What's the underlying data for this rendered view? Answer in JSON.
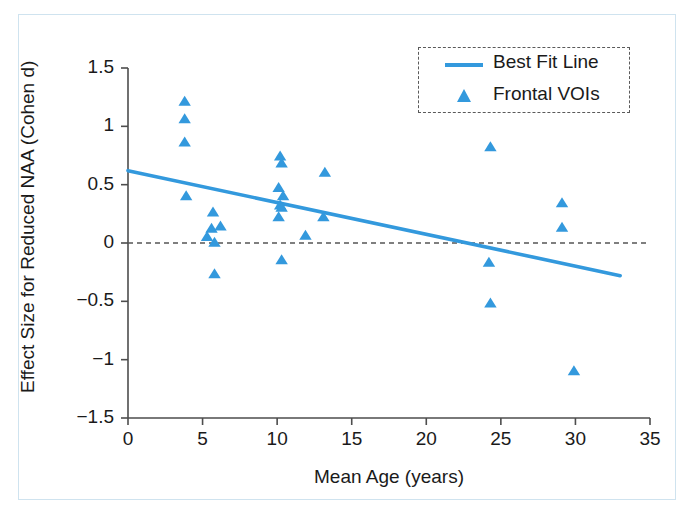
{
  "figure": {
    "background": "#ffffff",
    "frame_color": "#cfe3ef",
    "accent_color": "#3399dd",
    "text_color": "#1a1a1a"
  },
  "legend": {
    "position": "top-right",
    "border_style": "dashed",
    "entries": [
      {
        "label": "Best Fit Line",
        "marker": "line",
        "color": "#3399dd"
      },
      {
        "label": "Frontal VOIs",
        "marker": "triangle",
        "color": "#3399dd"
      }
    ]
  },
  "chart_data": {
    "type": "scatter",
    "title": "",
    "xlabel": "Mean Age (years)",
    "ylabel": "Effect Size for Reduced NAA (Cohen d)",
    "xlim": [
      0,
      35
    ],
    "ylim": [
      -1.5,
      1.5
    ],
    "xticks": [
      0,
      5,
      10,
      15,
      20,
      25,
      30,
      35
    ],
    "xticklabels": [
      "0",
      "5",
      "10",
      "15",
      "20",
      "25",
      "30",
      "35"
    ],
    "yticks": [
      -1.5,
      -1,
      -0.5,
      0,
      0.5,
      1,
      1.5
    ],
    "yticklabels": [
      "-1.5",
      "-1",
      "-0.5",
      "0",
      "0.5",
      "1",
      "1.5"
    ],
    "grid": false,
    "zero_reference_line": {
      "y": 0,
      "style": "dashed",
      "color": "#555555"
    },
    "series": [
      {
        "name": "Frontal VOIs",
        "marker": "triangle",
        "color": "#3399dd",
        "points": [
          {
            "x": 3.8,
            "y": 1.21
          },
          {
            "x": 3.8,
            "y": 1.06
          },
          {
            "x": 3.8,
            "y": 0.86
          },
          {
            "x": 3.9,
            "y": 0.4
          },
          {
            "x": 5.7,
            "y": 0.26
          },
          {
            "x": 5.6,
            "y": 0.12
          },
          {
            "x": 6.2,
            "y": 0.14
          },
          {
            "x": 5.3,
            "y": 0.05
          },
          {
            "x": 5.8,
            "y": 0.0
          },
          {
            "x": 5.8,
            "y": -0.27
          },
          {
            "x": 10.2,
            "y": 0.74
          },
          {
            "x": 10.3,
            "y": 0.68
          },
          {
            "x": 10.1,
            "y": 0.47
          },
          {
            "x": 10.4,
            "y": 0.4
          },
          {
            "x": 10.2,
            "y": 0.32
          },
          {
            "x": 10.3,
            "y": 0.3
          },
          {
            "x": 10.1,
            "y": 0.22
          },
          {
            "x": 10.3,
            "y": -0.15
          },
          {
            "x": 11.9,
            "y": 0.06
          },
          {
            "x": 13.2,
            "y": 0.6
          },
          {
            "x": 13.1,
            "y": 0.22
          },
          {
            "x": 24.3,
            "y": 0.82
          },
          {
            "x": 24.2,
            "y": -0.17
          },
          {
            "x": 24.3,
            "y": -0.52
          },
          {
            "x": 29.1,
            "y": 0.34
          },
          {
            "x": 29.1,
            "y": 0.13
          },
          {
            "x": 29.9,
            "y": -1.1
          }
        ]
      },
      {
        "name": "Best Fit Line",
        "marker": "line",
        "color": "#3399dd",
        "line": {
          "x0": 0,
          "y0": 0.62,
          "x1": 33,
          "y1": -0.28
        }
      }
    ]
  }
}
